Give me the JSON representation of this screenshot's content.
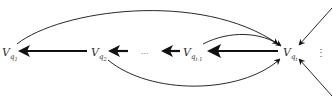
{
  "diagram": {
    "nodes": [
      {
        "id": "n1",
        "base": "V",
        "sub": "q",
        "subsub": "1"
      },
      {
        "id": "n2",
        "base": "V",
        "sub": "q",
        "subsub": "2"
      },
      {
        "id": "n3",
        "base": "V",
        "sub": "q",
        "subsub": "t-1"
      },
      {
        "id": "n4",
        "base": "V",
        "sub": "q",
        "subsub": "t"
      }
    ],
    "ellipsis_horizontal": "...",
    "ellipsis_vertical": "⋮",
    "edges": [
      {
        "from": "n2",
        "to": "n1",
        "style": "thick-straight"
      },
      {
        "from": "ellipsis",
        "to": "n2",
        "style": "thick-straight"
      },
      {
        "from": "n3",
        "to": "ellipsis",
        "style": "thick-straight"
      },
      {
        "from": "n4",
        "to": "n3",
        "style": "thick-straight"
      },
      {
        "from": "n1",
        "to": "n4",
        "style": "thin-curve-over"
      },
      {
        "from": "n2",
        "to": "n4",
        "style": "thin-curve-under"
      },
      {
        "from": "n3",
        "to": "n4",
        "style": "thin-curve-over"
      },
      {
        "from": "external-top",
        "to": "n4",
        "style": "thin-straight"
      },
      {
        "from": "external-bottom",
        "to": "n4",
        "style": "thin-straight"
      }
    ],
    "colors": {
      "stroke": "#111111",
      "label": "#333333"
    }
  }
}
